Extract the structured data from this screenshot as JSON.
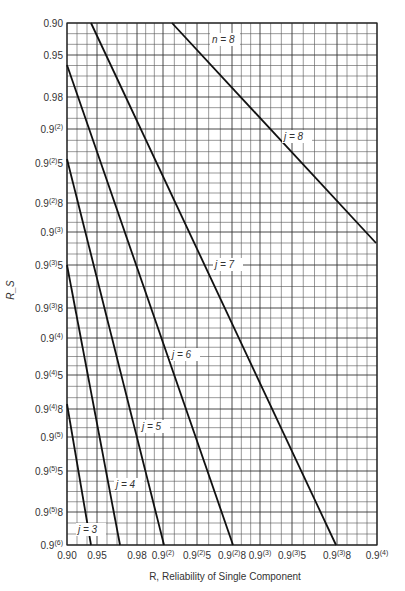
{
  "chart_data": {
    "type": "line",
    "title": "",
    "xlabel": "R, Reliability of Single Component",
    "ylabel": "R_S",
    "annotation": "n = 8",
    "x_ticks": [
      {
        "label": "0.90",
        "px": 67
      },
      {
        "label": "0.95",
        "px": 97
      },
      {
        "label": "0.98",
        "px": 137
      },
      {
        "label": "0.9(2)",
        "px": 163
      },
      {
        "label": "0.9(2)5",
        "px": 197
      },
      {
        "label": "0.9(2)8",
        "px": 232
      },
      {
        "label": "0.9(3)",
        "px": 260
      },
      {
        "label": "0.9(3)5",
        "px": 292
      },
      {
        "label": "0.9(3)8",
        "px": 337
      },
      {
        "label": "0.9(4)",
        "px": 377
      }
    ],
    "y_ticks": [
      {
        "label": "0.90",
        "px": 23
      },
      {
        "label": "0.95",
        "px": 55
      },
      {
        "label": "0.98",
        "px": 97
      },
      {
        "label": "0.9(2)",
        "px": 129
      },
      {
        "label": "0.9(2)5",
        "px": 163
      },
      {
        "label": "0.9(2)8",
        "px": 203
      },
      {
        "label": "0.9(3)",
        "px": 232
      },
      {
        "label": "0.9(3)5",
        "px": 265
      },
      {
        "label": "0.9(3)8",
        "px": 308
      },
      {
        "label": "0.9(4)",
        "px": 338
      },
      {
        "label": "0.9(4)5",
        "px": 375
      },
      {
        "label": "0.9(4)8",
        "px": 409
      },
      {
        "label": "0.9(5)",
        "px": 437
      },
      {
        "label": "0.9(5)5",
        "px": 471
      },
      {
        "label": "0.9(5)8",
        "px": 512
      },
      {
        "label": "0.9(6)",
        "px": 545
      }
    ],
    "series": [
      {
        "name": "j = 3",
        "points": [
          [
            67,
            404
          ],
          [
            91,
            545
          ]
        ],
        "label_pos": [
          78,
          533
        ]
      },
      {
        "name": "j = 4",
        "points": [
          [
            67,
            265
          ],
          [
            120,
            545
          ]
        ],
        "label_pos": [
          116,
          488
        ]
      },
      {
        "name": "j = 5",
        "points": [
          [
            67,
            159
          ],
          [
            164,
            545
          ]
        ],
        "label_pos": [
          142,
          430
        ]
      },
      {
        "name": "j = 6",
        "points": [
          [
            67,
            65
          ],
          [
            233,
            545
          ]
        ],
        "label_pos": [
          172,
          358
        ]
      },
      {
        "name": "j = 7",
        "points": [
          [
            91,
            23
          ],
          [
            336,
            545
          ]
        ],
        "label_pos": [
          215,
          268
        ]
      },
      {
        "name": "j = 8",
        "points": [
          [
            172,
            23
          ],
          [
            376,
            243
          ]
        ],
        "label_pos": [
          284,
          140
        ]
      }
    ],
    "xlim": [
      "0.90",
      "0.9(4)"
    ],
    "ylim": [
      "0.90",
      "0.9(6)"
    ],
    "grid": true
  }
}
